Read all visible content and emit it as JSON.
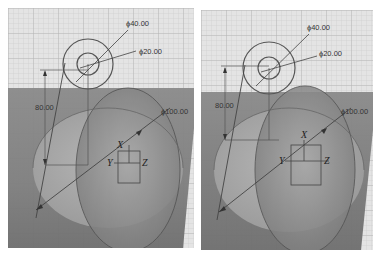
{
  "views": [
    {
      "id": "left",
      "dimensions": {
        "outer_diameter": "ϕ40.00",
        "inner_diameter": "ϕ20.00",
        "height": "80.00",
        "large_diameter": "ϕ100.00"
      },
      "axes": {
        "x": "X",
        "y": "Y",
        "z": "Z"
      }
    },
    {
      "id": "right",
      "dimensions": {
        "outer_diameter": "ϕ40.00",
        "inner_diameter": "ϕ20.00",
        "height": "80.00",
        "large_diameter": "ϕ100.00"
      },
      "axes": {
        "x": "X",
        "y": "Y",
        "z": "Z"
      }
    }
  ],
  "colors": {
    "grid_bg": "#e4e4e4",
    "grid_line": "#c8c8c8",
    "grid_major": "#b4b4b4",
    "solid_dark": "#7a7a7a",
    "solid_light": "#a6a6a6",
    "sketch_line": "#555555"
  }
}
